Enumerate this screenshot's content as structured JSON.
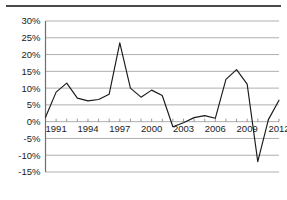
{
  "figure": {
    "top_rule_present": true,
    "background_color": "#ffffff"
  },
  "chart_data": {
    "type": "line",
    "title": "",
    "subtitle": "",
    "xlabel": "",
    "ylabel": "",
    "grid": true,
    "legend": null,
    "legend_position": "none",
    "line_color": "#1a1a1a",
    "grid_color": "#8c8c8c",
    "axis_color": "#6e6e6e",
    "xlim": [
      1990,
      2012
    ],
    "ylim": [
      -15,
      30
    ],
    "y_tick_labels": [
      "30%",
      "25%",
      "20%",
      "15%",
      "10%",
      "5%",
      "0%",
      "-5%",
      "-10%",
      "-15%"
    ],
    "y_tick_values": [
      30,
      25,
      20,
      15,
      10,
      5,
      0,
      -5,
      -10,
      -15
    ],
    "x_tick_labels": [
      "1991",
      "1994",
      "1997",
      "2000",
      "2003",
      "2006",
      "2009",
      "2012"
    ],
    "x_tick_values": [
      1991,
      1994,
      1997,
      2000,
      2003,
      2006,
      2009,
      2012
    ],
    "x_minor_step": 1,
    "x": [
      1990,
      1991,
      1992,
      1993,
      1994,
      1995,
      1996,
      1997,
      1998,
      1999,
      2000,
      2001,
      2002,
      2003,
      2004,
      2005,
      2006,
      2007,
      2008,
      2009,
      2010,
      2011,
      2012
    ],
    "values": [
      1.3,
      8.8,
      11.5,
      7.0,
      6.2,
      6.6,
      8.2,
      23.5,
      10.0,
      7.3,
      9.4,
      7.8,
      -1.5,
      -0.3,
      1.2,
      1.8,
      1.0,
      12.6,
      15.5,
      11.2,
      -11.9,
      0.6,
      6.4
    ],
    "annotations": []
  }
}
